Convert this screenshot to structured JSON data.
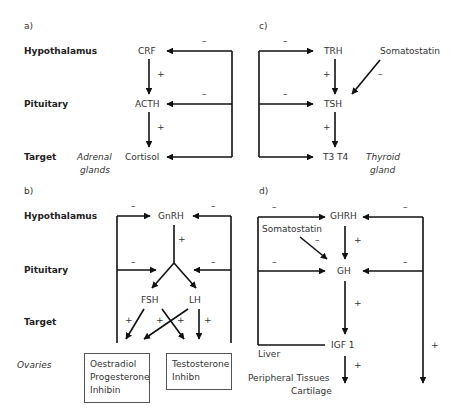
{
  "panels": {
    "a": {
      "label": "a)",
      "levels": [
        "Hypothalamus",
        "Pituitary",
        "Target"
      ],
      "nodes": {
        "hypothalamus": "CRF",
        "pituitary": "ACTH",
        "target": "Cortisol"
      },
      "target_tissue": [
        "Adrenal",
        "glands"
      ],
      "stimulation_signs": [
        "+",
        "+"
      ],
      "feedback_signs": [
        "–",
        "–"
      ]
    },
    "b": {
      "label": "b)",
      "levels": [
        "Hypothalamus",
        "Pituitary",
        "Target"
      ],
      "nodes": {
        "hypothalamus": "GnRH",
        "pituitary_left": "FSH",
        "pituitary_right": "LH"
      },
      "target_tissue": "Ovaries",
      "stimulation_signs": [
        "+",
        "+",
        "+",
        "+",
        "+"
      ],
      "feedback_signs": [
        "–",
        "–",
        "–",
        "–"
      ],
      "box_left": [
        "Oestradiol",
        "Progesterone",
        "Inhibin"
      ],
      "box_right": [
        "Testosterone",
        "Inhibn"
      ]
    },
    "c": {
      "label": "c)",
      "nodes": {
        "hypothalamus": "TRH",
        "pituitary": "TSH",
        "target": "T3 T4"
      },
      "inhibitor": "Somatostatin",
      "inhibitor_sign": "–",
      "target_tissue": [
        "Thyroid",
        "gland"
      ],
      "stimulation_signs": [
        "+",
        "+"
      ],
      "feedback_signs": [
        "–",
        "–"
      ]
    },
    "d": {
      "label": "d)",
      "nodes": {
        "hypothalamus": "GHRH",
        "pituitary": "GH",
        "target": "IGF 1"
      },
      "inhibitor": "Somatostatin",
      "inhibitor_sign": "–",
      "organ": "Liver",
      "effectors": [
        "Peripheral Tissues",
        "Cartilage"
      ],
      "stimulation_signs": [
        "+",
        "+",
        "+",
        "+"
      ],
      "feedback_signs": [
        "–",
        "–",
        "–",
        "–"
      ]
    }
  },
  "colors": {
    "line": "#111111",
    "text": "#333333",
    "box_border": "#555555"
  }
}
